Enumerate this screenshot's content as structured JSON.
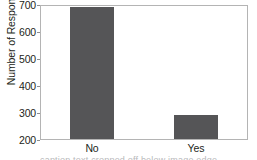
{
  "chart_data": {
    "type": "bar",
    "title": "",
    "subtitle": "",
    "xlabel": "",
    "ylabel": "Number of Responses",
    "categories": [
      "No",
      "Yes"
    ],
    "values": [
      690,
      290
    ],
    "ylim": [
      200,
      700
    ],
    "yticks": [
      200,
      300,
      400,
      500,
      600,
      700
    ],
    "ytick_labels": [
      "200",
      "300",
      "400",
      "500",
      "600",
      "700"
    ],
    "grid": false,
    "legend": false,
    "legend_position": "none",
    "bar_color": "#555557",
    "plot_background": "#ffffff",
    "frame_color": "#b4b4b4",
    "text_color": "#231f20",
    "annotations": []
  },
  "caption": {
    "clipped_text": "caption text cropped off below image edge"
  }
}
